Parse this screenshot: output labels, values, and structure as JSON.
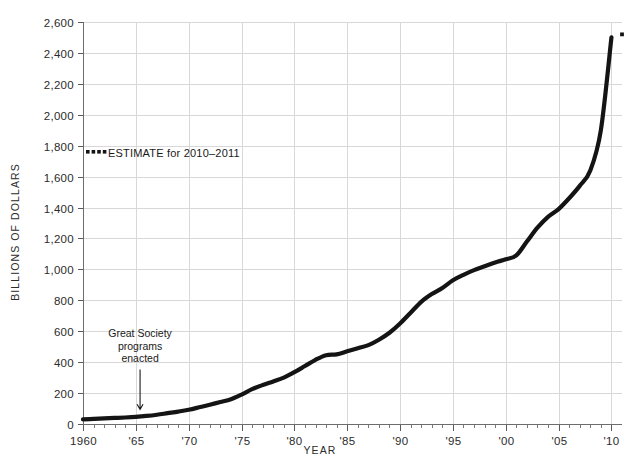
{
  "chart_data": {
    "type": "line",
    "title": "",
    "xlabel": "YEAR",
    "ylabel": "BILLIONS OF DOLLARS",
    "xlim": [
      1960,
      2011
    ],
    "ylim": [
      0,
      2600
    ],
    "grid": true,
    "legend_position": "upper-left-inside",
    "y_ticks": [
      0,
      200,
      400,
      600,
      800,
      1000,
      1200,
      1400,
      1600,
      1800,
      2000,
      2200,
      2400,
      2600
    ],
    "y_tick_labels": [
      "0",
      "200",
      "400",
      "600",
      "800",
      "1,000",
      "1,200",
      "1,400",
      "1,600",
      "1,800",
      "2,000",
      "2,200",
      "2,400",
      "2,600"
    ],
    "x_ticks": [
      1960,
      1965,
      1970,
      1975,
      1980,
      1985,
      1990,
      1995,
      2000,
      2005,
      2010
    ],
    "x_tick_labels": [
      "1960",
      "'65",
      "'70",
      "'75",
      "'80",
      "'85",
      "'90",
      "'95",
      "'00",
      "'05",
      "'10"
    ],
    "x_minor_tick_step": 1,
    "series": [
      {
        "name": "Spending",
        "color": "#141414",
        "x": [
          1960,
          1961,
          1962,
          1963,
          1964,
          1965,
          1966,
          1967,
          1968,
          1969,
          1970,
          1971,
          1972,
          1973,
          1974,
          1975,
          1976,
          1977,
          1978,
          1979,
          1980,
          1981,
          1982,
          1983,
          1984,
          1985,
          1986,
          1987,
          1988,
          1989,
          1990,
          1991,
          1992,
          1993,
          1994,
          1995,
          1996,
          1997,
          1998,
          1999,
          2000,
          2001,
          2002,
          2003,
          2004,
          2005,
          2006,
          2007,
          2008,
          2009,
          2010
        ],
        "values": [
          30,
          33,
          36,
          39,
          42,
          46,
          52,
          60,
          70,
          80,
          92,
          108,
          125,
          142,
          160,
          190,
          225,
          252,
          275,
          300,
          335,
          375,
          415,
          445,
          450,
          470,
          490,
          510,
          545,
          590,
          650,
          720,
          790,
          840,
          880,
          930,
          965,
          995,
          1020,
          1045,
          1065,
          1090,
          1180,
          1270,
          1340,
          1390,
          1460,
          1540,
          1640,
          1900,
          2500
        ]
      }
    ],
    "estimate_point": {
      "x": 2011,
      "y": 2520,
      "style": "dotted"
    },
    "legend": [
      {
        "label": "ESTIMATE for 2010–2011",
        "marker": "dotted-line",
        "color": "#141414"
      }
    ],
    "annotations": [
      {
        "name": "great-society-annotation",
        "lines": [
          "Great Society",
          "programs",
          "enacted"
        ],
        "x": 1965.4,
        "y": 560,
        "arrow_to_y": 95
      }
    ]
  }
}
